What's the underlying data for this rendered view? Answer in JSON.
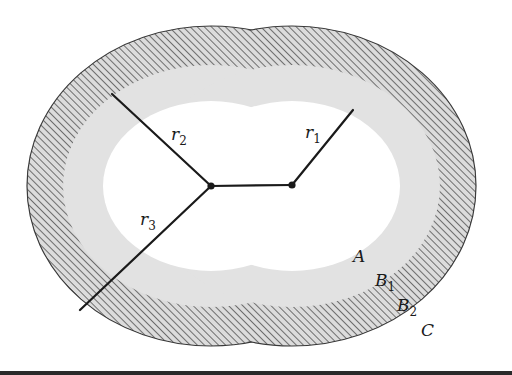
{
  "figure": {
    "centers": {
      "left": {
        "x": 211,
        "y": 186
      },
      "right": {
        "x": 292,
        "y": 185
      }
    },
    "radii_labels": [
      {
        "id": "r1",
        "base": "r",
        "sub": "1"
      },
      {
        "id": "r2",
        "base": "r",
        "sub": "2"
      },
      {
        "id": "r3",
        "base": "r",
        "sub": "3"
      }
    ],
    "region_labels": [
      {
        "id": "A",
        "base": "A",
        "sub": ""
      },
      {
        "id": "B1",
        "base": "B",
        "sub": "1"
      },
      {
        "id": "B2",
        "base": "B",
        "sub": "2"
      },
      {
        "id": "C",
        "base": "C",
        "sub": ""
      }
    ],
    "regions": {
      "A": {
        "fill": "#ffffff",
        "desc": "inner white region"
      },
      "B1": {
        "fill": "#e2e2e2",
        "desc": "light gray stippled band"
      },
      "B2": {
        "fill": "hatched",
        "desc": "diagonally hatched band"
      },
      "C": {
        "fill": "#ffffff",
        "desc": "exterior"
      }
    },
    "colors": {
      "line": "#1a1a1a",
      "gray_band": "#e2e2e2",
      "hatch_line": "#6e6e6e",
      "hatch_bg": "#dcdcdc",
      "outline": "#3a3a3a"
    }
  }
}
